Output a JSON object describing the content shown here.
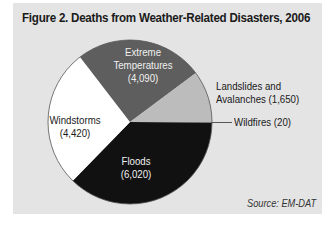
{
  "title": "Figure 2. Deaths from Weather-Related Disasters, 2006",
  "source": "Source: EM-DAT",
  "colors": {
    "background": "#e4e4e4",
    "floods": "#111111",
    "windstorms": "#ffffff",
    "extreme_temperatures": "#5e5e5e",
    "landslides": "#bcbcbc",
    "wildfires": "#888888"
  },
  "labels": {
    "extreme_name1": "Extreme",
    "extreme_name2": "Temperatures",
    "extreme_value": "(4,090)",
    "landslides_line1": "Landslides and",
    "landslides_line2": "Avalanches (1,650)",
    "wildfires": "Wildfires (20)",
    "windstorms_name": "Windstorms",
    "windstorms_value": "(4,420)",
    "floods_name": "Floods",
    "floods_value": "(6,020)"
  },
  "chart_data": {
    "type": "pie",
    "title": "Figure 2. Deaths from Weather-Related Disasters, 2006",
    "categories": [
      "Wildfires",
      "Floods",
      "Windstorms",
      "Extreme Temperatures",
      "Landslides and Avalanches"
    ],
    "values": [
      20,
      6020,
      4420,
      4090,
      1650
    ],
    "total": 16200,
    "start_angle": "3 o'clock, clockwise",
    "annotations": [
      "Source: EM-DAT"
    ],
    "legend": "none (direct labels)"
  }
}
